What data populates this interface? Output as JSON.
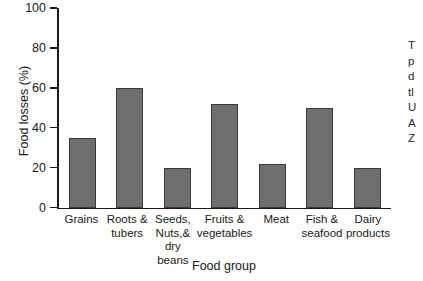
{
  "chart_data": {
    "type": "bar",
    "title": "",
    "xlabel": "Food group",
    "ylabel": "Food losses (%)",
    "categories": [
      "Grains",
      "Roots &\ntubers",
      "Seeds,\nNuts,&\ndry beans",
      "Fruits &\nvegetables",
      "Meat",
      "Fish &\nseafood",
      "Dairy\nproducts"
    ],
    "values": [
      35,
      60,
      20,
      52,
      22,
      50,
      20
    ],
    "ylim": [
      0,
      100
    ],
    "yticks": [
      0,
      20,
      40,
      60,
      80,
      100
    ],
    "ytick_labels": [
      "0",
      "20",
      "40",
      "60",
      "80",
      "100"
    ],
    "grid": false,
    "legend": false,
    "bar_color": "#6e6e6e",
    "bar_edge_color": "#3a3a3a",
    "axis_color": "#1a1a1a"
  },
  "side_caption": {
    "clipped": true,
    "lines": [
      "T",
      "p",
      "d",
      "tl",
      "U",
      "A",
      "Z"
    ]
  }
}
